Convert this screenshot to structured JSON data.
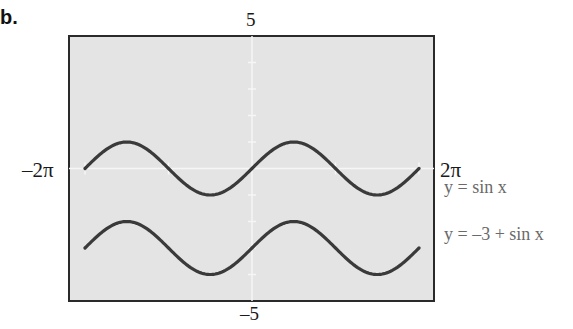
{
  "part_label": "b.",
  "chart_data": {
    "type": "line",
    "title": "",
    "xlabel": "",
    "ylabel": "",
    "xlim": [
      "-2π",
      "2π"
    ],
    "xlim_numeric": [
      -6.2832,
      6.2832
    ],
    "ylim": [
      -5,
      5
    ],
    "tick_labels": {
      "ymax": "5",
      "ymin": "-5",
      "xmin": "-2π",
      "xmax": "2π"
    },
    "grid": false,
    "background": "#e6e6e6",
    "series": [
      {
        "name": "y = sin x",
        "expression": "sin(x)",
        "offset": 0,
        "color": "#3a3a3a"
      },
      {
        "name": "y = −3 + sin x",
        "expression": "-3 + sin(x)",
        "offset": -3,
        "color": "#3a3a3a"
      }
    ],
    "legend_position": "right"
  },
  "labels": {
    "ymax": "5",
    "ymin": "–5",
    "xmin": "–2π",
    "xmax": "2π",
    "legend1": "y = sin x",
    "legend2": "y = –3 + sin x"
  }
}
